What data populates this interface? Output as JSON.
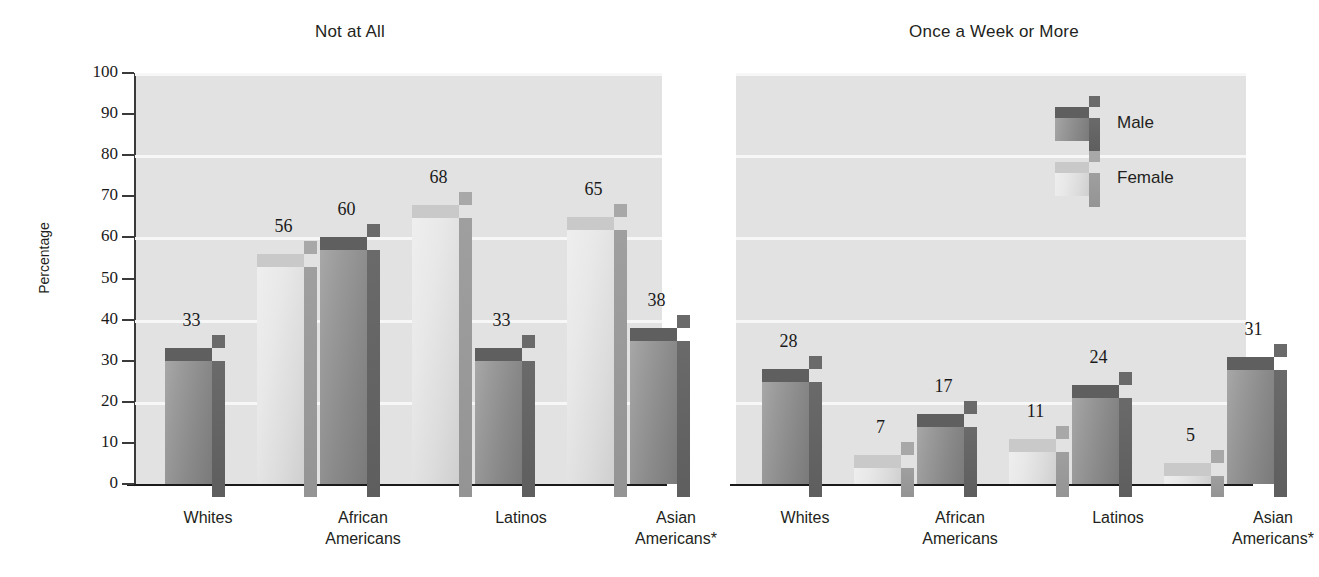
{
  "chart_data": [
    {
      "type": "bar",
      "title": "Not at All",
      "xlabel": "",
      "ylabel": "Percentage",
      "ylim": [
        0,
        100
      ],
      "yticks": [
        0,
        10,
        20,
        30,
        40,
        50,
        60,
        70,
        80,
        90,
        100
      ],
      "gridlines": [
        20,
        40,
        60,
        80,
        100
      ],
      "grid": true,
      "categories": [
        "Whites",
        "African\nAmericans",
        "Latinos",
        "Asian\nAmericans*"
      ],
      "series": [
        {
          "name": "Male",
          "values": [
            33,
            60,
            33,
            38
          ]
        },
        {
          "name": "Female",
          "values": [
            56,
            68,
            65,
            null
          ]
        }
      ]
    },
    {
      "type": "bar",
      "title": "Once a Week or More",
      "xlabel": "",
      "ylabel": "",
      "ylim": [
        0,
        100
      ],
      "yticks": [],
      "gridlines": [
        20,
        40,
        60,
        80,
        100
      ],
      "grid": true,
      "legend_position": "top-right",
      "categories": [
        "Whites",
        "African\nAmericans",
        "Latinos",
        "Asian\nAmericans*"
      ],
      "series": [
        {
          "name": "Male",
          "values": [
            28,
            17,
            24,
            31
          ]
        },
        {
          "name": "Female",
          "values": [
            7,
            11,
            5,
            null
          ]
        }
      ]
    }
  ],
  "left": {
    "title": "Not at All",
    "axis_title": "Percentage",
    "yticks": [
      "100",
      "90",
      "80",
      "70",
      "60",
      "50",
      "40",
      "30",
      "20",
      "10",
      "0"
    ],
    "categories": [
      {
        "line1": "Whites",
        "line2": ""
      },
      {
        "line1": "African",
        "line2": "Americans"
      },
      {
        "line1": "Latinos",
        "line2": ""
      },
      {
        "line1": "Asian",
        "line2": "Americans*"
      }
    ],
    "bars": [
      {
        "group": "Whites",
        "series": "Male",
        "value": 33,
        "label": "33"
      },
      {
        "group": "Whites",
        "series": "Female",
        "value": 56,
        "label": "56"
      },
      {
        "group": "African Americans",
        "series": "Male",
        "value": 60,
        "label": "60"
      },
      {
        "group": "African Americans",
        "series": "Female",
        "value": 68,
        "label": "68"
      },
      {
        "group": "Latinos",
        "series": "Male",
        "value": 33,
        "label": "33"
      },
      {
        "group": "Latinos",
        "series": "Female",
        "value": 65,
        "label": "65"
      },
      {
        "group": "Asian Americans",
        "series": "Male",
        "value": 38,
        "label": "38"
      }
    ]
  },
  "right": {
    "title": "Once a Week or More",
    "categories": [
      {
        "line1": "Whites",
        "line2": ""
      },
      {
        "line1": "African",
        "line2": "Americans"
      },
      {
        "line1": "Latinos",
        "line2": ""
      },
      {
        "line1": "Asian",
        "line2": "Americans*"
      }
    ],
    "legend": [
      {
        "label": "Male"
      },
      {
        "label": "Female"
      }
    ],
    "bars": [
      {
        "group": "Whites",
        "series": "Male",
        "value": 28,
        "label": "28"
      },
      {
        "group": "Whites",
        "series": "Female",
        "value": 7,
        "label": "7"
      },
      {
        "group": "African Americans",
        "series": "Male",
        "value": 17,
        "label": "17"
      },
      {
        "group": "African Americans",
        "series": "Female",
        "value": 11,
        "label": "11"
      },
      {
        "group": "Latinos",
        "series": "Male",
        "value": 24,
        "label": "24"
      },
      {
        "group": "Latinos",
        "series": "Female",
        "value": 5,
        "label": "5"
      },
      {
        "group": "Asian Americans",
        "series": "Male",
        "value": 31,
        "label": "31"
      }
    ]
  },
  "colors": {
    "plot_background": "#e2e2e2",
    "gridline": "#f7f7f7",
    "male_bar": "#8a8a8a",
    "female_bar": "#dcdcdc",
    "axis": "#1a1a1a",
    "text": "#231f20"
  }
}
